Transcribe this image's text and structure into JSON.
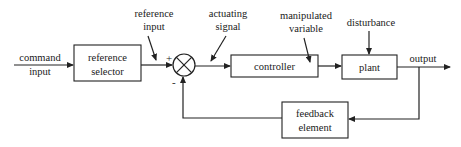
{
  "diagram": {
    "type": "feedback-control-block-diagram",
    "blocks": {
      "reference_selector": [
        "reference",
        "selector"
      ],
      "controller": [
        "controller"
      ],
      "plant": [
        "plant"
      ],
      "feedback_element": [
        "feedback",
        "element"
      ]
    },
    "signals": {
      "command_input": [
        "command",
        "input"
      ],
      "reference_input": [
        "reference",
        "input"
      ],
      "actuating_signal": [
        "actuating",
        "signal"
      ],
      "manipulated_variable": [
        "manipulated",
        "variable"
      ],
      "disturbance": [
        "disturbance"
      ],
      "output": [
        "output"
      ]
    },
    "summing_junction": {
      "plus_sign": "+",
      "minus_sign": "-"
    },
    "colors": {
      "line": "#222222",
      "background": "#ffffff"
    }
  }
}
